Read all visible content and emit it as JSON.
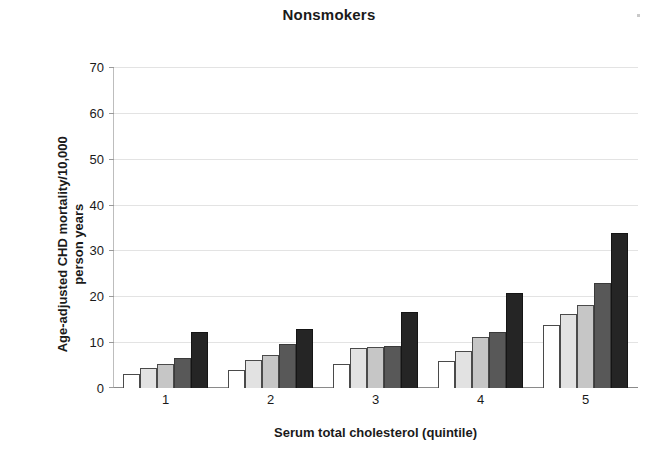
{
  "chart_data": {
    "type": "bar",
    "title": "Nonsmokers",
    "xlabel": "Serum total cholesterol (quintile)",
    "ylabel": "Age-adjusted CHD mortality/10,000 person years",
    "ylabel_lines": [
      "Age-adjusted CHD mortality/10,000",
      "person years"
    ],
    "categories": [
      "1",
      "2",
      "3",
      "4",
      "5"
    ],
    "ylim": [
      0,
      70
    ],
    "yticks": [
      70,
      60,
      50,
      40,
      30,
      20,
      10,
      0
    ],
    "ytick_labels": [
      "70",
      "60",
      "50",
      "40",
      "30",
      "20",
      "10",
      "0"
    ],
    "grid": true,
    "legend": "none",
    "series": [
      {
        "name": "Series 1",
        "shade": "#ffffff",
        "values": [
          3.0,
          3.9,
          5.3,
          6.0,
          13.8
        ]
      },
      {
        "name": "Series 2",
        "shade": "#e2e2e2",
        "values": [
          4.3,
          6.1,
          8.7,
          8.1,
          16.1
        ]
      },
      {
        "name": "Series 3",
        "shade": "#c6c6c6",
        "values": [
          5.2,
          7.2,
          9.0,
          11.1,
          18.0
        ]
      },
      {
        "name": "Series 4",
        "shade": "#585858",
        "values": [
          6.5,
          9.7,
          9.1,
          12.3,
          23.0
        ]
      },
      {
        "name": "Series 5",
        "shade": "#252525",
        "values": [
          12.3,
          12.8,
          16.5,
          20.7,
          33.8
        ]
      }
    ]
  },
  "colors": {
    "gridline": "#e3e3e3",
    "axis": "#8a8a8a",
    "text": "#1a1a1a"
  }
}
